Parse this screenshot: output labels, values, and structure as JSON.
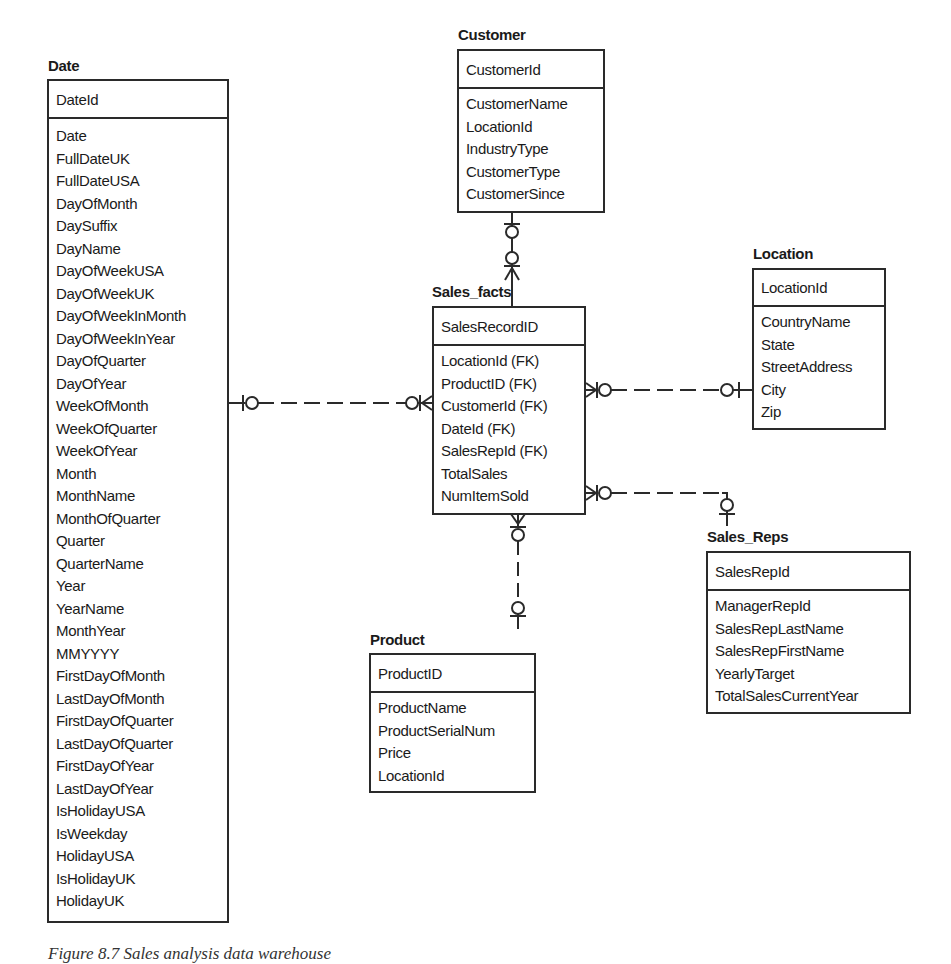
{
  "diagram": {
    "type": "star-schema ER diagram",
    "entities": {
      "date": {
        "title": "Date",
        "primary_key": "DateId",
        "attributes": [
          "Date",
          "FullDateUK",
          "FullDateUSA",
          "DayOfMonth",
          "DaySuffix",
          "DayName",
          "DayOfWeekUSA",
          "DayOfWeekUK",
          "DayOfWeekInMonth",
          "DayOfWeekInYear",
          "DayOfQuarter",
          "DayOfYear",
          "WeekOfMonth",
          "WeekOfQuarter",
          "WeekOfYear",
          "Month",
          "MonthName",
          "MonthOfQuarter",
          "Quarter",
          "QuarterName",
          "Year",
          "YearName",
          "MonthYear",
          "MMYYYY",
          "FirstDayOfMonth",
          "LastDayOfMonth",
          "FirstDayOfQuarter",
          "LastDayOfQuarter",
          "FirstDayOfYear",
          "LastDayOfYear",
          "IsHolidayUSA",
          "IsWeekday",
          "HolidayUSA",
          "IsHolidayUK",
          "HolidayUK"
        ]
      },
      "customer": {
        "title": "Customer",
        "primary_key": "CustomerId",
        "attributes": [
          "CustomerName",
          "LocationId",
          "IndustryType",
          "CustomerType",
          "CustomerSince"
        ]
      },
      "sales_facts": {
        "title": "Sales_facts",
        "primary_key": "SalesRecordID",
        "attributes": [
          "LocationId (FK)",
          "ProductID (FK)",
          "CustomerId (FK)",
          "DateId (FK)",
          "SalesRepId (FK)",
          "TotalSales",
          "NumItemSold"
        ]
      },
      "location": {
        "title": "Location",
        "primary_key": "LocationId",
        "attributes": [
          "CountryName",
          "State",
          "StreetAddress",
          "City",
          "Zip"
        ]
      },
      "sales_reps": {
        "title": "Sales_Reps",
        "primary_key": "SalesRepId",
        "attributes": [
          "ManagerRepId",
          "SalesRepLastName",
          "SalesRepFirstName",
          "YearlyTarget",
          "TotalSalesCurrentYear"
        ]
      },
      "product": {
        "title": "Product",
        "primary_key": "ProductID",
        "attributes": [
          "ProductName",
          "ProductSerialNum",
          "Price",
          "LocationId"
        ]
      }
    },
    "relationships": [
      {
        "from": "Date",
        "to": "Sales_facts",
        "from_cardinality": "zero-or-one",
        "to_cardinality": "zero-or-many",
        "line": "dashed"
      },
      {
        "from": "Customer",
        "to": "Sales_facts",
        "from_cardinality": "zero-or-one",
        "to_cardinality": "zero-or-many",
        "line": "solid"
      },
      {
        "from": "Location",
        "to": "Sales_facts",
        "from_cardinality": "zero-or-one",
        "to_cardinality": "zero-or-many",
        "line": "dashed"
      },
      {
        "from": "Sales_Reps",
        "to": "Sales_facts",
        "from_cardinality": "zero-or-one",
        "to_cardinality": "zero-or-many",
        "line": "dashed"
      },
      {
        "from": "Product",
        "to": "Sales_facts",
        "from_cardinality": "zero-or-one",
        "to_cardinality": "zero-or-many",
        "line": "dashed"
      }
    ]
  },
  "caption": "Figure 8.7  Sales analysis data warehouse"
}
